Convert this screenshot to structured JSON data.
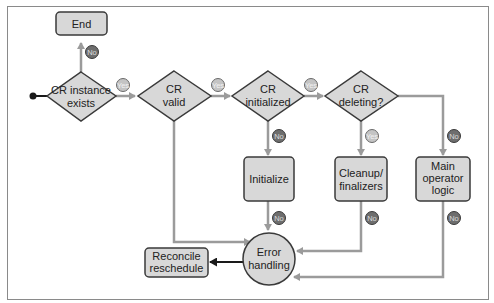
{
  "colors": {
    "node_fill": "#d8d8d8",
    "node_stroke": "#3a3a3a",
    "edge_gray": "#9b9b9b",
    "edge_dark": "#1a1a1a",
    "badge_yes_fill": "#c4c4c4",
    "badge_no_fill": "#6e6e6e",
    "frame": "#8a8a8a"
  },
  "nodes": {
    "end": {
      "label": "End"
    },
    "cr_exists": {
      "line1": "CR instance",
      "line2": "exists"
    },
    "cr_valid": {
      "line1": "CR",
      "line2": "valid"
    },
    "cr_initialized": {
      "line1": "CR",
      "line2": "initialized"
    },
    "cr_deleting": {
      "line1": "CR",
      "line2": "deleting?"
    },
    "initialize": {
      "label": "Initialize"
    },
    "cleanup": {
      "line1": "Cleanup/",
      "line2": "finalizers"
    },
    "main_logic": {
      "line1": "Main",
      "line2": "operator",
      "line3": "logic"
    },
    "error_handling": {
      "line1": "Error",
      "line2": "handling"
    },
    "reconcile": {
      "line1": "Reconcile",
      "line2": "reschedule"
    }
  },
  "badges": {
    "yes": "Yes",
    "no": "No"
  }
}
